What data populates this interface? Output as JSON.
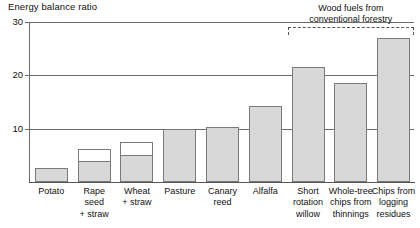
{
  "chart_data": {
    "type": "bar",
    "title": "Energy balance ratio",
    "xlabel": "",
    "ylabel": "Energy balance ratio",
    "ylim": [
      0,
      30
    ],
    "yticks": [
      10,
      20,
      30
    ],
    "grid": true,
    "legend": "none",
    "categories": [
      "Potato",
      "Rape seed + straw",
      "Wheat + straw",
      "Pasture",
      "Canary reed",
      "Alfalfa",
      "Short rotation willow",
      "Whole-tree chips from thinnings",
      "Chips from logging residues"
    ],
    "category_lines": [
      [
        "Potato"
      ],
      [
        "Rape",
        "seed",
        "+ straw"
      ],
      [
        "Wheat",
        "+ straw"
      ],
      [
        "Pasture"
      ],
      [
        "Canary",
        "reed"
      ],
      [
        "Alfalfa"
      ],
      [
        "Short",
        "rotation",
        "willow"
      ],
      [
        "Whole-tree",
        "chips from",
        "thinnings"
      ],
      [
        "Chips from",
        "logging",
        "residues"
      ]
    ],
    "series": [
      {
        "name": "Main crop energy balance ratio",
        "color": "#d8d8d8",
        "values": [
          2.7,
          3.7,
          4.8,
          10.0,
          10.4,
          14.2,
          21.5,
          18.5,
          27.0
        ]
      },
      {
        "name": "Straw contribution",
        "color": "#ffffff",
        "values": [
          0,
          2.5,
          2.7,
          0,
          0,
          0,
          0,
          0,
          0
        ]
      }
    ],
    "totals": [
      2.7,
      6.2,
      7.5,
      10.0,
      10.4,
      14.2,
      21.5,
      18.5,
      27.0
    ],
    "annotations": [
      {
        "name": "wood-fuels-bracket",
        "text_lines": [
          "Wood fuels from",
          "conventional forestry"
        ],
        "covers_categories": [
          "Short rotation willow",
          "Whole-tree chips from thinnings",
          "Chips from logging residues"
        ],
        "style": "dashed-bracket"
      }
    ]
  },
  "axis": {
    "tick_labels": [
      "30",
      "20",
      "10"
    ]
  }
}
